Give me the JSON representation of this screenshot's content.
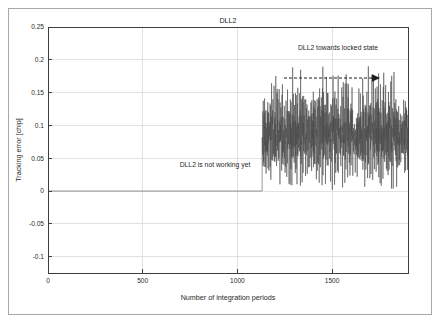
{
  "figure": {
    "border_color": "#a8a8a8",
    "background": "#ffffff"
  },
  "chart_data": {
    "type": "line",
    "title": "DLL2",
    "xlabel": "Number of integration periods",
    "ylabel": "Tracking error [chip]",
    "xlim": [
      0,
      1900
    ],
    "ylim": [
      -0.125,
      0.25
    ],
    "grid": true,
    "legend": false,
    "legend_position": "none",
    "xticks": [
      0,
      500,
      1000,
      1500
    ],
    "xtick_labels": [
      "0",
      "500",
      "1000",
      "1500"
    ],
    "yticks": [
      -0.1,
      -0.05,
      0,
      0.05,
      0.1,
      0.15,
      0.2,
      0.25
    ],
    "ytick_labels": [
      "-0.1",
      "-0.05",
      "0",
      "0.05",
      "0.1",
      "0.15",
      "0.2",
      "0.25"
    ],
    "series": [
      {
        "name": "DLL2 tracking error",
        "color": "#4a4a4a",
        "description": "Flat at 0 until ~1130 integration periods, then noisy oscillation centered near 0.085 chip with peaks up to ~0.20 and troughs near 0.00",
        "flat_segment": {
          "x_start": 0,
          "x_end": 1130,
          "y": 0
        },
        "noise_segment": {
          "x_start": 1130,
          "x_end": 1900,
          "mean": 0.085,
          "min": 0.0,
          "max": 0.201,
          "samples": 770
        },
        "values": [
          0.104,
          0.062,
          0.088,
          0.071,
          0.097,
          0.053,
          0.118,
          0.079,
          0.066,
          0.092,
          0.11,
          0.048,
          0.083,
          0.121,
          0.058,
          0.095,
          0.073,
          0.129,
          0.061,
          0.087,
          0.102,
          0.044,
          0.113,
          0.076,
          0.091,
          0.056,
          0.124,
          0.068,
          0.099,
          0.081,
          0.135,
          0.051,
          0.106,
          0.072,
          0.093,
          0.115,
          0.04,
          0.085,
          0.127,
          0.063,
          0.098,
          0.077,
          0.142,
          0.055,
          0.09,
          0.108,
          0.035,
          0.119,
          0.07,
          0.096,
          0.159,
          0.046,
          0.084,
          0.131,
          0.06,
          0.101,
          0.075,
          0.122,
          0.052,
          0.089,
          0.114,
          0.03,
          0.094,
          0.137,
          0.066,
          0.082,
          0.105,
          0.043,
          0.126,
          0.071,
          0.1,
          0.058,
          0.148,
          0.078,
          0.086,
          0.112,
          0.025,
          0.092,
          0.133,
          0.064,
          0.18,
          0.049,
          0.103,
          0.074,
          0.128,
          0.056,
          0.087,
          0.116,
          0.038,
          0.095,
          0.14,
          0.068,
          0.081,
          0.107,
          0.02,
          0.123,
          0.072,
          0.098,
          0.054,
          0.152,
          0.076,
          0.088,
          0.111,
          0.032,
          0.091,
          0.13,
          0.062,
          0.165,
          0.047,
          0.102,
          0.073,
          0.125,
          0.059,
          0.085,
          0.118,
          0.042,
          0.097,
          0.139,
          0.067,
          0.08,
          0.109,
          0.015,
          0.121,
          0.07,
          0.099,
          0.051,
          0.146,
          0.077,
          0.084,
          0.113,
          0.028,
          0.093,
          0.132,
          0.065,
          0.171,
          0.045,
          0.104,
          0.075,
          0.127,
          0.057,
          0.086,
          0.117,
          0.036,
          0.096,
          0.141,
          0.069,
          0.079,
          0.106,
          0.018,
          0.12,
          0.071,
          0.1,
          0.05,
          0.15,
          0.078,
          0.083,
          0.11,
          0.026,
          0.09,
          0.134,
          0.063,
          0.163,
          0.048,
          0.101,
          0.076,
          0.124,
          0.061,
          0.088,
          0.115,
          0.039,
          0.094,
          0.138,
          0.066,
          0.082,
          0.108,
          0.022,
          0.122,
          0.074,
          0.097,
          0.053,
          0.144,
          0.08,
          0.085,
          0.112,
          0.031,
          0.092,
          0.129,
          0.064,
          0.157,
          0.044,
          0.103,
          0.077,
          0.126,
          0.058,
          0.089,
          0.119,
          0.034,
          0.098,
          0.143,
          0.07,
          0.081,
          0.105,
          0.012,
          0.201,
          0.072,
          0.096,
          0.055,
          0.147,
          0.079,
          0.087,
          0.114,
          0.029,
          0.091,
          0.136,
          0.062,
          0.156,
          0.046,
          0.102,
          0.075,
          0.123,
          0.06,
          0.09,
          0.116,
          0.041,
          0.095,
          0.148,
          0.068,
          0.083,
          0.107,
          0.024,
          0.121,
          0.073,
          0.099,
          0.052,
          0.131,
          0.078,
          0.086,
          0.111,
          0.033,
          0.093
        ]
      }
    ],
    "annotations": [
      {
        "name": "not-working-annotation",
        "text": "DLL2 is not working yet",
        "x": 880,
        "y": 0.038
      },
      {
        "name": "locked-state-annotation",
        "text": "DLL2 towards locked state",
        "x": 1530,
        "y": 0.218
      }
    ],
    "arrow": {
      "name": "locked-state-arrow",
      "style": "dashed-right-arrow",
      "x_start": 1245,
      "x_end": 1680,
      "y": 0.178
    }
  }
}
